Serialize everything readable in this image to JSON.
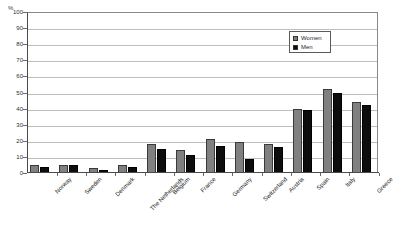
{
  "chart_data": {
    "type": "bar",
    "title": "",
    "xlabel": "",
    "ylabel": "%",
    "ylim": [
      0,
      100
    ],
    "ytick_step": 10,
    "yticks": [
      "100",
      "90",
      "80",
      "70",
      "60",
      "50",
      "40",
      "30",
      "20",
      "10",
      "0"
    ],
    "grid": true,
    "legend_position": "top-right",
    "categories": [
      "Norway",
      "Sweden",
      "Denmark",
      "The Netherlands",
      "Belgium",
      "France",
      "Germany",
      "Switzerland",
      "Austria",
      "Spain",
      "Italy",
      "Greece"
    ],
    "series": [
      {
        "name": "Women",
        "color": "#808080",
        "values": [
          5,
          5,
          3,
          5,
          18,
          14,
          21,
          19,
          18,
          40,
          52,
          44
        ]
      },
      {
        "name": "Men",
        "color": "#0d0d0d",
        "values": [
          4,
          5,
          2,
          4,
          15,
          11,
          17,
          9,
          16,
          39,
          50,
          42
        ]
      }
    ]
  },
  "legend": {
    "items": [
      {
        "label": "Women"
      },
      {
        "label": "Men"
      }
    ]
  },
  "axis": {
    "percent_symbol": "%"
  },
  "title_remnant": ""
}
